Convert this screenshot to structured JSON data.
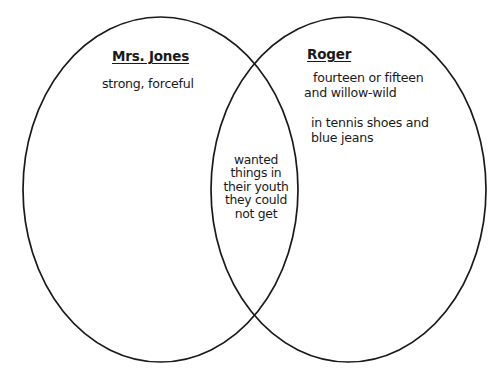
{
  "diagram": {
    "type": "venn",
    "title_left": "Mrs. Jones",
    "title_right": "Roger",
    "stroke_color": "#1a1a1a",
    "text_color": "#1a1a1a",
    "background_color": "#ffffff",
    "left_circle": {
      "label": "Mrs. Jones",
      "traits": [
        {
          "lines": [
            "strong, forceful"
          ]
        }
      ]
    },
    "right_circle": {
      "label": "Roger",
      "traits": [
        {
          "lines": [
            "fourteen or fifteen",
            "and willow-wild"
          ]
        },
        {
          "lines": [
            "in tennis shoes and",
            "blue jeans"
          ]
        }
      ]
    },
    "intersection": {
      "lines": [
        "wanted",
        "things in",
        "their youth",
        "they could",
        "not get"
      ]
    }
  }
}
